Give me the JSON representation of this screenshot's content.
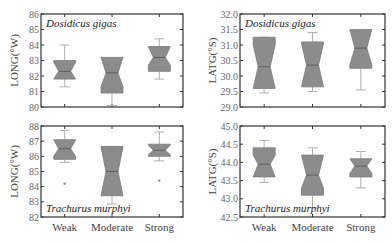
{
  "figure": {
    "panels": [
      {
        "id": "top-left",
        "species": "Dosidicus gigas",
        "ylabel": "LONG(°W)"
      },
      {
        "id": "top-right",
        "species": "Dosidicus gigas",
        "ylabel": "LATG(°S)"
      },
      {
        "id": "bottom-left",
        "species": "Trachurus murphyi",
        "ylabel": "LONG(°W)"
      },
      {
        "id": "bottom-right",
        "species": "Trachurus murphyi",
        "ylabel": "LATG(°S)"
      }
    ],
    "categories": [
      "Weak",
      "Moderate",
      "Strong"
    ]
  },
  "chart_data": [
    {
      "type": "box",
      "title": "Dosidicus gigas",
      "xlabel": "",
      "ylabel": "LONG(°W)",
      "ylim": [
        80,
        86
      ],
      "yticks": [
        "80",
        "81",
        "82",
        "83",
        "84",
        "85",
        "86"
      ],
      "categories": [
        "Weak",
        "Moderate",
        "Strong"
      ],
      "notched": true,
      "boxes": [
        {
          "category": "Weak",
          "whisker_low": 81.3,
          "q1": 81.8,
          "median": 82.3,
          "q3": 83.0,
          "whisker_high": 84.0,
          "notch_low": 81.8,
          "notch_high": 82.9,
          "outliers": []
        },
        {
          "category": "Moderate",
          "whisker_low": 80.1,
          "q1": 80.9,
          "median": 82.2,
          "q3": 82.7,
          "whisker_high": 82.7,
          "notch_low": 81.3,
          "notch_high": 83.2,
          "outliers": []
        },
        {
          "category": "Strong",
          "whisker_low": 81.8,
          "q1": 82.3,
          "median": 83.2,
          "q3": 83.5,
          "whisker_high": 84.4,
          "notch_low": 82.7,
          "notch_high": 83.9,
          "outliers": []
        }
      ]
    },
    {
      "type": "box",
      "title": "Dosidicus gigas",
      "xlabel": "",
      "ylabel": "LATG(°S)",
      "ylim": [
        29.0,
        32.0
      ],
      "yticks": [
        "29.0",
        "29.5",
        "30.0",
        "30.5",
        "31.0",
        "31.5",
        "32.0"
      ],
      "categories": [
        "Weak",
        "Moderate",
        "Strong"
      ],
      "notched": true,
      "boxes": [
        {
          "category": "Weak",
          "whisker_low": 29.45,
          "q1": 29.75,
          "median": 30.3,
          "q3": 31.25,
          "whisker_high": 31.25,
          "notch_low": 29.6,
          "notch_high": 31.0,
          "outliers": []
        },
        {
          "category": "Moderate",
          "whisker_low": 29.5,
          "q1": 29.9,
          "median": 30.35,
          "q3": 31.1,
          "whisker_high": 31.4,
          "notch_low": 29.65,
          "notch_high": 31.05,
          "outliers": []
        },
        {
          "category": "Strong",
          "whisker_low": 29.55,
          "q1": 30.25,
          "median": 30.9,
          "q3": 31.45,
          "whisker_high": 31.45,
          "notch_low": 30.35,
          "notch_high": 31.5,
          "outliers": []
        }
      ]
    },
    {
      "type": "box",
      "title": "Trachurus murphyi",
      "xlabel": "",
      "ylabel": "LONG(°W)",
      "ylim": [
        82,
        88
      ],
      "yticks": [
        "82",
        "83",
        "84",
        "85",
        "86",
        "87",
        "88"
      ],
      "categories": [
        "Weak",
        "Moderate",
        "Strong"
      ],
      "notched": true,
      "boxes": [
        {
          "category": "Weak",
          "whisker_low": 85.6,
          "q1": 85.8,
          "median": 86.5,
          "q3": 86.8,
          "whisker_high": 87.7,
          "notch_low": 86.0,
          "notch_high": 87.1,
          "outliers": [
            84.2
          ]
        },
        {
          "category": "Moderate",
          "whisker_low": 82.85,
          "q1": 83.7,
          "median": 85.0,
          "q3": 86.65,
          "whisker_high": 86.65,
          "notch_low": 83.4,
          "notch_high": 86.6,
          "outliers": []
        },
        {
          "category": "Strong",
          "whisker_low": 85.7,
          "q1": 86.0,
          "median": 86.4,
          "q3": 86.8,
          "whisker_high": 87.6,
          "notch_low": 86.1,
          "notch_high": 86.75,
          "outliers": [
            84.4
          ]
        }
      ]
    },
    {
      "type": "box",
      "title": "Trachurus murphyi",
      "xlabel": "",
      "ylabel": "LATG(°S)",
      "ylim": [
        42.5,
        45.0
      ],
      "yticks": [
        "42.5",
        "43.0",
        "43.5",
        "44.0",
        "44.5",
        "45.0"
      ],
      "categories": [
        "Weak",
        "Moderate",
        "Strong"
      ],
      "notched": true,
      "boxes": [
        {
          "category": "Weak",
          "whisker_low": 43.45,
          "q1": 43.7,
          "median": 43.95,
          "q3": 44.4,
          "whisker_high": 44.6,
          "notch_low": 43.6,
          "notch_high": 44.2,
          "outliers": []
        },
        {
          "category": "Moderate",
          "whisker_low": 42.75,
          "q1": 43.1,
          "median": 43.65,
          "q3": 44.1,
          "whisker_high": 44.4,
          "notch_low": 43.3,
          "notch_high": 44.2,
          "outliers": []
        },
        {
          "category": "Strong",
          "whisker_low": 43.3,
          "q1": 43.6,
          "median": 43.9,
          "q3": 44.0,
          "whisker_high": 44.3,
          "notch_low": 43.7,
          "notch_high": 44.1,
          "outliers": []
        }
      ]
    }
  ]
}
